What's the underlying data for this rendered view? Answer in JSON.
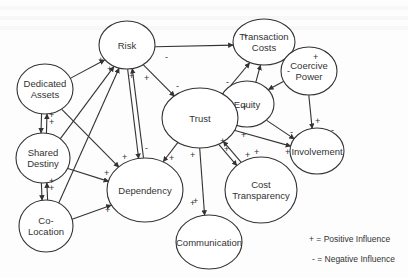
{
  "diagram": {
    "nodes": [
      {
        "id": "risk",
        "lines": [
          "Risk"
        ],
        "cx": 127,
        "cy": 45,
        "rx": 28,
        "ry": 24
      },
      {
        "id": "transaction_costs",
        "lines": [
          "Transaction",
          "Costs"
        ],
        "cx": 264,
        "cy": 42,
        "rx": 31,
        "ry": 23
      },
      {
        "id": "coercive_power",
        "lines": [
          "Coercive",
          "Power"
        ],
        "cx": 309,
        "cy": 71,
        "rx": 28,
        "ry": 24
      },
      {
        "id": "dedicated_assets",
        "lines": [
          "Dedicated",
          "Assets"
        ],
        "cx": 45,
        "cy": 89,
        "rx": 28,
        "ry": 25
      },
      {
        "id": "equity",
        "lines": [
          "Equity"
        ],
        "cx": 247,
        "cy": 104,
        "rx": 27,
        "ry": 23
      },
      {
        "id": "trust",
        "lines": [
          "Trust"
        ],
        "cx": 200,
        "cy": 118,
        "rx": 38,
        "ry": 30
      },
      {
        "id": "involvement",
        "lines": [
          "Involvement"
        ],
        "cx": 317,
        "cy": 151,
        "rx": 27,
        "ry": 23
      },
      {
        "id": "shared_destiny",
        "lines": [
          "Shared",
          "Destiny"
        ],
        "cx": 43,
        "cy": 158,
        "rx": 27,
        "ry": 25
      },
      {
        "id": "dependency",
        "lines": [
          "Dependency"
        ],
        "cx": 145,
        "cy": 190,
        "rx": 38,
        "ry": 32
      },
      {
        "id": "cost_transparency",
        "lines": [
          "Cost",
          "Transparency"
        ],
        "cx": 261,
        "cy": 190,
        "rx": 36,
        "ry": 33
      },
      {
        "id": "co_location",
        "lines": [
          "Co-",
          "Location"
        ],
        "cx": 46,
        "cy": 226,
        "rx": 27,
        "ry": 26
      },
      {
        "id": "communication",
        "lines": [
          "Communication"
        ],
        "cx": 209,
        "cy": 242,
        "rx": 33,
        "ry": 27
      }
    ],
    "edges": [
      {
        "from": "risk",
        "to": "transaction_costs",
        "sign": "+"
      },
      {
        "from": "dedicated_assets",
        "to": "risk",
        "sign": "+"
      },
      {
        "from": "shared_destiny",
        "to": "risk",
        "sign": "+"
      },
      {
        "from": "co_location",
        "to": "risk",
        "sign": "+"
      },
      {
        "from": "dependency",
        "to": "risk",
        "sign": "+"
      },
      {
        "from": "risk",
        "to": "trust",
        "sign": "-"
      },
      {
        "from": "risk",
        "to": "dependency",
        "sign": "+"
      },
      {
        "from": "dedicated_assets",
        "to": "shared_destiny",
        "sign": "+"
      },
      {
        "from": "shared_destiny",
        "to": "dedicated_assets",
        "sign": "+"
      },
      {
        "from": "dedicated_assets",
        "to": "dependency",
        "sign": "+"
      },
      {
        "from": "shared_destiny",
        "to": "dependency",
        "sign": "+"
      },
      {
        "from": "co_location",
        "to": "dependency",
        "sign": "+"
      },
      {
        "from": "shared_destiny",
        "to": "co_location",
        "sign": "+"
      },
      {
        "from": "co_location",
        "to": "shared_destiny",
        "sign": "+"
      },
      {
        "from": "trust",
        "to": "transaction_costs",
        "sign": "-"
      },
      {
        "from": "trust",
        "to": "dependency",
        "sign": "-"
      },
      {
        "from": "trust",
        "to": "communication",
        "sign": "+"
      },
      {
        "from": "trust",
        "to": "cost_transparency",
        "sign": "+"
      },
      {
        "from": "cost_transparency",
        "to": "trust",
        "sign": "+"
      },
      {
        "from": "trust",
        "to": "involvement",
        "sign": "+"
      },
      {
        "from": "equity",
        "to": "trust",
        "sign": "+"
      },
      {
        "from": "equity",
        "to": "transaction_costs",
        "sign": "-"
      },
      {
        "from": "equity",
        "to": "involvement",
        "sign": "+"
      },
      {
        "from": "coercive_power",
        "to": "transaction_costs",
        "sign": "+"
      },
      {
        "from": "coercive_power",
        "to": "equity",
        "sign": "-"
      },
      {
        "from": "coercive_power",
        "to": "involvement",
        "sign": "-"
      }
    ],
    "signs": [
      {
        "t": "+",
        "x": 98,
        "y": 63
      },
      {
        "t": "+",
        "x": 107,
        "y": 72
      },
      {
        "t": "+",
        "x": 129,
        "y": 79
      },
      {
        "t": "+",
        "x": 144,
        "y": 81
      },
      {
        "t": "-",
        "x": 176,
        "y": 89
      },
      {
        "t": "+",
        "x": 243,
        "y": 39
      },
      {
        "t": "-",
        "x": 246,
        "y": 64
      },
      {
        "t": "-",
        "x": 226,
        "y": 85
      },
      {
        "t": "+",
        "x": 313,
        "y": 60
      },
      {
        "t": "-",
        "x": 287,
        "y": 74
      },
      {
        "t": "+",
        "x": 242,
        "y": 110
      },
      {
        "t": "+",
        "x": 241,
        "y": 138
      },
      {
        "t": "-",
        "x": 290,
        "y": 135
      },
      {
        "t": "-",
        "x": 331,
        "y": 133
      },
      {
        "t": "+",
        "x": 315,
        "y": 124
      },
      {
        "t": "+",
        "x": 49,
        "y": 118
      },
      {
        "t": "+",
        "x": 49,
        "y": 125
      },
      {
        "t": "+",
        "x": 49,
        "y": 184
      },
      {
        "t": "+",
        "x": 49,
        "y": 191
      },
      {
        "t": "+",
        "x": 122,
        "y": 160
      },
      {
        "t": "-",
        "x": 145,
        "y": 151
      },
      {
        "t": "+",
        "x": 169,
        "y": 161
      },
      {
        "t": "+",
        "x": 104,
        "y": 176
      },
      {
        "t": "+",
        "x": 105,
        "y": 213
      },
      {
        "t": "+",
        "x": 190,
        "y": 158
      },
      {
        "t": "+",
        "x": 224,
        "y": 152
      },
      {
        "t": "+",
        "x": 254,
        "y": 155
      },
      {
        "t": "+",
        "x": 285,
        "y": 155
      },
      {
        "t": "+",
        "x": 190,
        "y": 206
      },
      {
        "t": "+",
        "x": 245,
        "y": 158
      },
      {
        "t": "+",
        "x": 220,
        "y": 144
      },
      {
        "t": "-",
        "x": 165,
        "y": 60
      },
      {
        "t": "+",
        "x": 193,
        "y": 204
      }
    ]
  },
  "legend": {
    "positive": "+ = Positive Influence",
    "negative": "- =  Negative Influence"
  }
}
